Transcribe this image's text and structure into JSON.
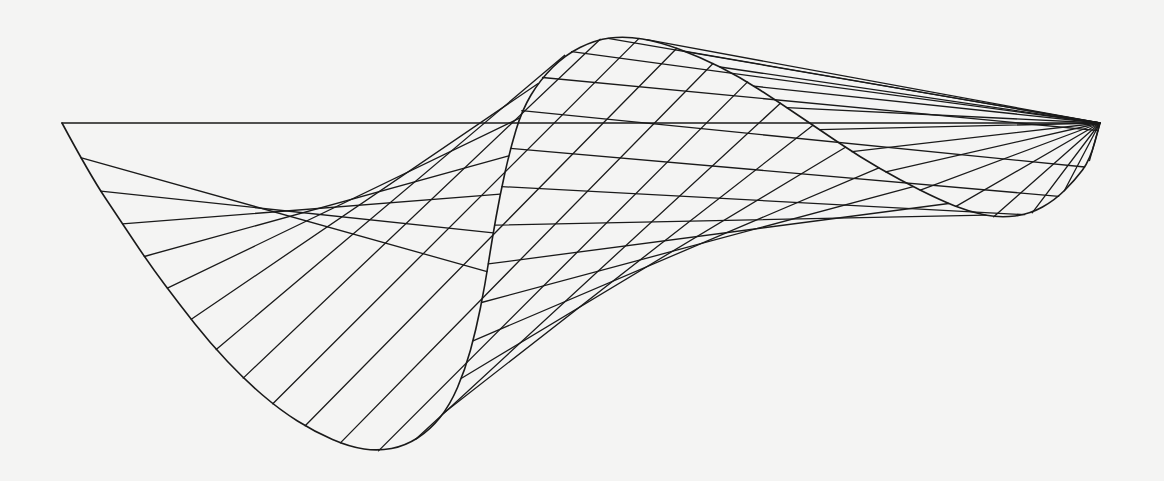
{
  "figure": {
    "background": "#f4f4f3",
    "stroke_color": "#1a1a1a",
    "top_edge": {
      "x1": 62,
      "y1": 123,
      "x2": 1100,
      "y2": 123
    },
    "left_curve": [
      [
        62,
        123
      ],
      [
        90,
        175
      ],
      [
        120,
        220
      ],
      [
        150,
        265
      ],
      [
        180,
        305
      ],
      [
        210,
        343
      ],
      [
        245,
        380
      ],
      [
        280,
        410
      ],
      [
        315,
        432
      ],
      [
        350,
        447
      ],
      [
        378,
        451
      ],
      [
        405,
        446
      ],
      [
        430,
        430
      ],
      [
        450,
        405
      ],
      [
        465,
        370
      ],
      [
        476,
        330
      ],
      [
        485,
        285
      ],
      [
        492,
        240
      ],
      [
        500,
        195
      ],
      [
        510,
        150
      ],
      [
        522,
        110
      ],
      [
        540,
        80
      ],
      [
        565,
        55
      ],
      [
        595,
        40
      ],
      [
        625,
        36
      ],
      [
        660,
        42
      ],
      [
        700,
        57
      ],
      [
        740,
        77
      ],
      [
        780,
        103
      ],
      [
        820,
        130
      ],
      [
        860,
        157
      ],
      [
        900,
        180
      ],
      [
        940,
        200
      ],
      [
        970,
        212
      ],
      [
        1000,
        218
      ],
      [
        1030,
        214
      ],
      [
        1055,
        200
      ],
      [
        1075,
        180
      ],
      [
        1090,
        160
      ],
      [
        1100,
        123
      ]
    ],
    "lower_envelope": [
      [
        378,
        451
      ],
      [
        420,
        420
      ],
      [
        450,
        380
      ],
      [
        470,
        330
      ],
      [
        485,
        270
      ],
      [
        500,
        215
      ],
      [
        520,
        170
      ],
      [
        550,
        140
      ],
      [
        590,
        128
      ],
      [
        640,
        124
      ],
      [
        700,
        128
      ],
      [
        760,
        143
      ],
      [
        820,
        165
      ],
      [
        880,
        188
      ],
      [
        940,
        205
      ],
      [
        1000,
        218
      ]
    ],
    "left_fan_count": 28,
    "right_fan_count": 14
  }
}
